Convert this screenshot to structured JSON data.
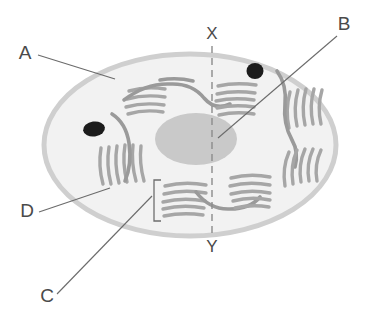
{
  "figure": {
    "background_color": "#ffffff"
  },
  "colors": {
    "cytoplasm_fill": "#f2f2f2",
    "membrane_stroke": "#cfcfcf",
    "nucleus_fill": "#c9c9c9",
    "granule_fill": "#1c1c1c",
    "er_stroke": "#a6a6a6",
    "leader_stroke": "#6b6b6b",
    "label_text": "#4a4a4a",
    "axis_dashed_stroke": "#8c8c8c"
  },
  "callouts": [
    {
      "id": "A",
      "label": "A",
      "label_x": 25,
      "label_y": 59,
      "target_description": "cell membrane, upper-left edge",
      "leader_from_x": 38,
      "leader_from_y": 55,
      "leader_to_x": 115,
      "leader_to_y": 79
    },
    {
      "id": "B",
      "label": "B",
      "label_x": 344,
      "label_y": 30,
      "target_description": "nucleus",
      "leader_from_x": 337,
      "leader_from_y": 36,
      "leader_to_x": 218,
      "leader_to_y": 138
    },
    {
      "id": "C",
      "label": "C",
      "label_x": 47,
      "label_y": 302,
      "target_description": "bracketed endoplasmic reticulum stack at base of cell",
      "leader_from_x": 57,
      "leader_from_y": 294,
      "leader_to_x": 152,
      "leader_to_y": 196
    },
    {
      "id": "D",
      "label": "D",
      "label_x": 27,
      "label_y": 217,
      "target_description": "cytoplasm, lower-left interior",
      "leader_from_x": 39,
      "leader_from_y": 212,
      "leader_to_x": 110,
      "leader_to_y": 188
    }
  ],
  "axis": {
    "top_label": "X",
    "top_label_x": 212,
    "top_label_y": 39,
    "bottom_label": "Y",
    "bottom_label_x": 212,
    "bottom_label_y": 252,
    "line_x": 212,
    "line_top_y": 46,
    "line_bottom_y": 236,
    "style": "dashed"
  },
  "cell": {
    "center_x": 190,
    "center_y": 145,
    "radius_x": 148,
    "radius_y": 93
  },
  "nucleus": {
    "center_x": 196,
    "center_y": 139,
    "radius_x": 41,
    "radius_y": 26
  },
  "granules": [
    {
      "name": "granule-left",
      "cx": 94,
      "cy": 129,
      "rx": 11,
      "ry": 7.5,
      "rotation": -8
    },
    {
      "name": "granule-right",
      "cx": 255,
      "cy": 71,
      "rx": 8.5,
      "ry": 8,
      "rotation": 0
    }
  ],
  "bracket": {
    "x": 154,
    "top_y": 180,
    "bottom_y": 221,
    "arm": 7
  },
  "er_groups": [
    {
      "name": "er-top-left",
      "cisternae": 4
    },
    {
      "name": "er-top-right",
      "cisternae": 5
    },
    {
      "name": "er-left",
      "cisternae": 7
    },
    {
      "name": "er-right-upper",
      "cisternae": 6
    },
    {
      "name": "er-right-lower",
      "cisternae": 5
    },
    {
      "name": "er-bottom-left",
      "cisternae": 6
    },
    {
      "name": "er-bottom-right",
      "cisternae": 6
    }
  ]
}
